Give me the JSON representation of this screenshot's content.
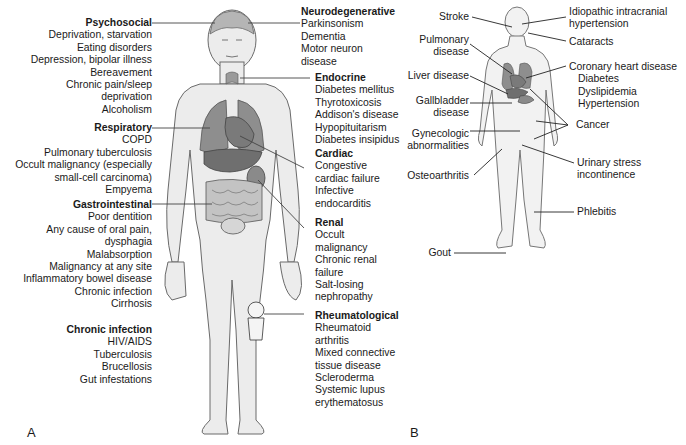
{
  "panel_a": {
    "letter": "A",
    "left_groups": [
      {
        "title": "Psychosocial",
        "items": [
          "Deprivation, starvation",
          "Eating disorders",
          "Depression, bipolar illness",
          "Bereavement",
          "Chronic pain/sleep",
          "deprivation",
          "Alcoholism"
        ]
      },
      {
        "title": "Respiratory",
        "items": [
          "COPD",
          "Pulmonary tuberculosis",
          "Occult malignancy (especially",
          "small-cell carcinoma)",
          "Empyema"
        ]
      },
      {
        "title": "Gastrointestinal",
        "items": [
          "Poor dentition",
          "Any cause of oral pain,",
          "dysphagia",
          "Malabsorption",
          "Malignancy at any site",
          "Inflammatory bowel disease",
          "Chronic infection",
          "Cirrhosis"
        ]
      },
      {
        "title": "Chronic infection",
        "items": [
          "HIV/AIDS",
          "Tuberculosis",
          "Brucellosis",
          "Gut infestations"
        ]
      }
    ],
    "right_groups": [
      {
        "title": "Neurodegenerative",
        "items": [
          "Parkinsonism",
          "Dementia",
          "Motor neuron",
          "disease"
        ]
      },
      {
        "title": "Endocrine",
        "items": [
          "Diabetes mellitus",
          "Thyrotoxicosis",
          "Addison's disease",
          "Hypopituitarism",
          "Diabetes insipidus"
        ]
      },
      {
        "title": "Cardiac",
        "items": [
          "Congestive",
          "cardiac failure",
          "Infective",
          "endocarditis"
        ]
      },
      {
        "title": "Renal",
        "items": [
          "Occult",
          "malignancy",
          "Chronic renal",
          "failure",
          "Salt-losing",
          "nephropathy"
        ]
      },
      {
        "title": "Rheumatological",
        "items": [
          "Rheumatoid",
          "arthritis",
          "Mixed connective",
          "tissue disease",
          "Scleroderma",
          "Systemic lupus",
          "erythematosus"
        ]
      }
    ]
  },
  "panel_b": {
    "letter": "B",
    "labels": {
      "stroke": "Stroke",
      "iih": [
        "Idiopathic intracranial",
        "hypertension"
      ],
      "cataracts": "Cataracts",
      "pulmonary": [
        "Pulmonary",
        "disease"
      ],
      "liver": "Liver disease",
      "chd": "Coronary heart disease",
      "chd_items": [
        "Diabetes",
        "Dyslipidemia",
        "Hypertension"
      ],
      "gallbladder": [
        "Gallbladder",
        "disease"
      ],
      "cancer": "Cancer",
      "gyn": [
        "Gynecologic",
        "abnormalities"
      ],
      "osteo": "Osteoarthritis",
      "urinary": [
        "Urinary stress",
        "incontinence"
      ],
      "phlebitis": "Phlebitis",
      "gout": "Gout"
    }
  },
  "colors": {
    "body_fill": "#ececec",
    "body_outline": "#6a6a6a",
    "organ_fill": "#8e8e8e",
    "organ_dark": "#6f6f6f",
    "leader_line": "#222222"
  }
}
